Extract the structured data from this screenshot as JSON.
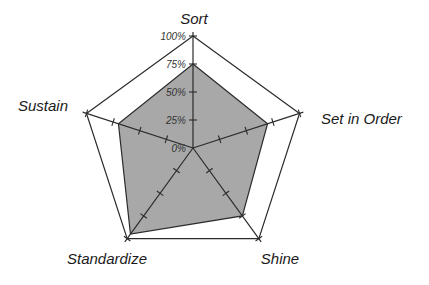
{
  "chart_data": {
    "type": "radar",
    "title": "",
    "categories": [
      "Sort",
      "Set in Order",
      "Shine",
      "Standardize",
      "Sustain"
    ],
    "series": [
      {
        "name": "Score",
        "values": [
          75,
          70,
          75,
          95,
          70
        ]
      }
    ],
    "radial_ticks": [
      "0%",
      "25%",
      "50%",
      "75%",
      "100%"
    ],
    "range": [
      0,
      100
    ],
    "grid": "outer pentagon only",
    "legend": "none"
  },
  "style": {
    "fill_color": "#a8a8a8",
    "line_color": "#2b2b2b",
    "background": "#ffffff"
  }
}
